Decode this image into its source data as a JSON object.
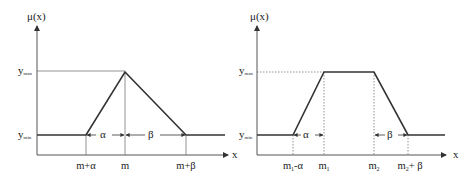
{
  "diagrams": [
    {
      "name": "triangular-membership-function",
      "y_axis_label": "μ(x)",
      "x_axis_label": "x",
      "y_max_label": "y",
      "y_max_sub": "max",
      "y_min_label": "y",
      "y_min_sub": "min",
      "x_ticks": [
        "m+α",
        "m",
        "m+β"
      ],
      "alpha_label": "α",
      "beta_label": "β"
    },
    {
      "name": "trapezoidal-membership-function",
      "y_axis_label": "μ(x)",
      "x_axis_label": "x",
      "y_max_label": "y",
      "y_max_sub": "max",
      "y_min_label": "y",
      "y_min_sub": "min",
      "x_ticks": [
        "m1-α",
        "m1",
        "m2",
        "m2+β"
      ],
      "tick_parts": {
        "m1_minus_alpha": {
          "base": "m",
          "sub": "1",
          "suffix": "-α"
        },
        "m1": {
          "base": "m",
          "sub": "1",
          "suffix": ""
        },
        "m2": {
          "base": "m",
          "sub": "2",
          "suffix": ""
        },
        "m2_plus_beta": {
          "base": "m",
          "sub": "2",
          "suffix": "+ β"
        }
      },
      "alpha_label": "α",
      "beta_label": "β"
    }
  ]
}
